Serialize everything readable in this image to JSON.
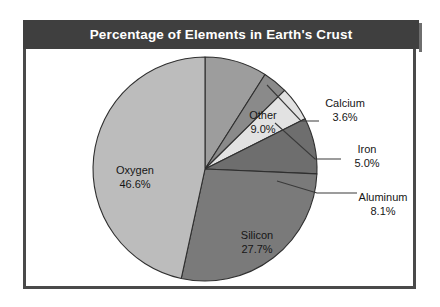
{
  "title": "Percentage of Elements in Earth's Crust",
  "colors": {
    "frame": "#4a4a4a",
    "title_bar": "#3f3f3f",
    "title_text": "#ffffff",
    "background": "#ffffff",
    "outline": "#2f2f2f"
  },
  "chart_data": {
    "type": "pie",
    "title": "Percentage of Elements in Earth's Crust",
    "xlabel": "",
    "ylabel": "",
    "unit": "%",
    "start_angle_deg": 0,
    "direction": "clockwise",
    "legend": "none",
    "grid": false,
    "categories": [
      "Other",
      "Calcium",
      "Iron",
      "Aluminum",
      "Silicon",
      "Oxygen"
    ],
    "values": [
      9.0,
      3.6,
      5.0,
      8.1,
      27.7,
      46.6
    ],
    "slices": [
      {
        "name": "Other",
        "label": "Other",
        "value": 9.0,
        "value_text": "9.0%",
        "color": "#9d9d9d",
        "label_placement": "inside"
      },
      {
        "name": "Calcium",
        "label": "Calcium",
        "value": 3.6,
        "value_text": "3.6%",
        "color": "#8a8a8a",
        "label_placement": "callout"
      },
      {
        "name": "Iron",
        "label": "Iron",
        "value": 5.0,
        "value_text": "5.0%",
        "color": "#e2e2e2",
        "label_placement": "callout"
      },
      {
        "name": "Aluminum",
        "label": "Aluminum",
        "value": 8.1,
        "value_text": "8.1%",
        "color": "#6e6e6e",
        "label_placement": "callout"
      },
      {
        "name": "Silicon",
        "label": "Silicon",
        "value": 27.7,
        "value_text": "27.7%",
        "color": "#7a7a7a",
        "label_placement": "inside"
      },
      {
        "name": "Oxygen",
        "label": "Oxygen",
        "value": 46.6,
        "value_text": "46.6%",
        "color": "#bcbcbc",
        "label_placement": "inside"
      }
    ]
  }
}
